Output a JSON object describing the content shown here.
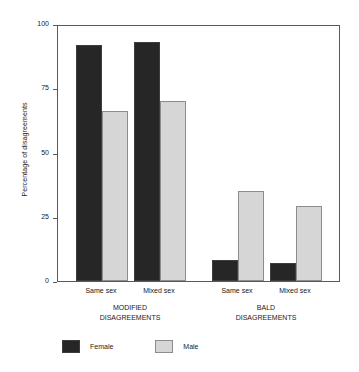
{
  "chart_data": {
    "type": "bar",
    "title": "",
    "xlabel": "",
    "ylabel": "Percentage of disagreements",
    "ylim": [
      0,
      100
    ],
    "yticks": [
      0,
      25,
      50,
      75,
      100
    ],
    "ytick_labels": [
      "0",
      "25",
      "50",
      "75",
      "100"
    ],
    "grid": false,
    "legend_position": "bottom-left",
    "categories": [
      "Same sex",
      "Mixed sex",
      "Same sex",
      "Mixed sex"
    ],
    "groups": [
      {
        "label_line1": "MODIFIED",
        "label_line2": "DISAGREEMENTS",
        "categories": [
          "Same sex",
          "Mixed sex"
        ]
      },
      {
        "label_line1": "BALD",
        "label_line2": "DISAGREEMENTS",
        "categories": [
          "Same sex",
          "Mixed sex"
        ]
      }
    ],
    "series": [
      {
        "name": "Female",
        "color": "#262626",
        "values": [
          92,
          93,
          8,
          7
        ]
      },
      {
        "name": "Male",
        "color": "#d6d6d6",
        "values": [
          66,
          70,
          35,
          29
        ]
      }
    ],
    "bars": [
      {
        "group": "MODIFIED DISAGREEMENTS",
        "category": "Same sex",
        "series": "Female",
        "value": 92
      },
      {
        "group": "MODIFIED DISAGREEMENTS",
        "category": "Same sex",
        "series": "Male",
        "value": 66
      },
      {
        "group": "MODIFIED DISAGREEMENTS",
        "category": "Mixed sex",
        "series": "Female",
        "value": 93
      },
      {
        "group": "MODIFIED DISAGREEMENTS",
        "category": "Mixed sex",
        "series": "Male",
        "value": 70
      },
      {
        "group": "BALD DISAGREEMENTS",
        "category": "Same sex",
        "series": "Female",
        "value": 8
      },
      {
        "group": "BALD DISAGREEMENTS",
        "category": "Same sex",
        "series": "Male",
        "value": 35
      },
      {
        "group": "BALD DISAGREEMENTS",
        "category": "Mixed sex",
        "series": "Female",
        "value": 7
      },
      {
        "group": "BALD DISAGREEMENTS",
        "category": "Mixed sex",
        "series": "Male",
        "value": 29
      }
    ],
    "legend": [
      {
        "label": "Female",
        "color": "#262626"
      },
      {
        "label": "Male",
        "color": "#d6d6d6"
      }
    ]
  }
}
